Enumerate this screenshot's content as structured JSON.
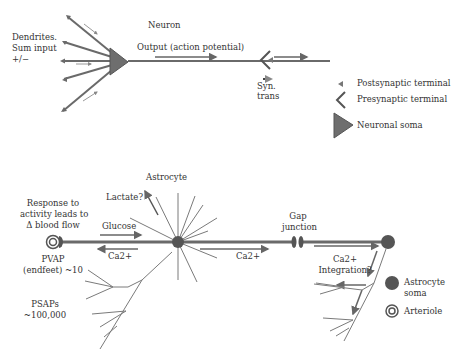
{
  "neuron": {
    "title": "Neuron",
    "dendrites_label_1": "Dendrites.",
    "dendrites_label_2": "Sum input",
    "dendrites_label_3": "+/−",
    "output_label": "Output (action potential)",
    "syn_label_1": "Syn.",
    "syn_label_2": "trans"
  },
  "legend_top": {
    "items": [
      {
        "icon": "postsynaptic-terminal-icon",
        "label": "Postsynaptic terminal"
      },
      {
        "icon": "presynaptic-terminal-icon",
        "label": "Presynaptic terminal"
      },
      {
        "icon": "neuronal-soma-icon",
        "label": "Neuronal soma"
      }
    ]
  },
  "astrocyte": {
    "title": "Astrocyte",
    "lactate_label": "Lactate?",
    "response_label_1": "Response to",
    "response_label_2": "activity leads to",
    "response_label_3": "Δ blood flow",
    "glucose_label": "Glucose",
    "ca_left_label": "Ca2+",
    "ca_mid_label": "Ca2+",
    "pvap_label_1": "PVAP",
    "pvap_label_2": "(endfeet) ~10",
    "psaps_label_1": "PSAPs",
    "psaps_label_2": "~100,000",
    "gap_label_1": "Gap",
    "gap_label_2": "junction",
    "integration_label_1": "Ca2+",
    "integration_label_2": "Integration?"
  },
  "legend_bottom": {
    "items": [
      {
        "icon": "astrocyte-soma-icon",
        "label_1": "Astrocyte",
        "label_2": "soma"
      },
      {
        "icon": "arteriole-icon",
        "label": "Arteriole"
      }
    ]
  },
  "colors": {
    "line": "#6a6a6a",
    "soma": "#6e6e6e",
    "text": "#333333"
  }
}
